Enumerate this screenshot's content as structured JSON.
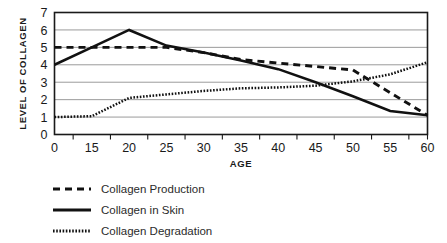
{
  "chart_data": {
    "type": "line",
    "title": "",
    "xlabel": "AGE",
    "ylabel": "LEVEL OF COLLAGEN",
    "categories": [
      "0",
      "15",
      "20",
      "25",
      "30",
      "35",
      "40",
      "45",
      "50",
      "55",
      "60"
    ],
    "x": [
      0,
      15,
      20,
      25,
      30,
      35,
      40,
      45,
      50,
      55,
      60
    ],
    "ylim": [
      0,
      7
    ],
    "yticks": [
      "0",
      "1",
      "2",
      "3",
      "4",
      "5",
      "6",
      "7"
    ],
    "grid": true,
    "legend_position": "below-left",
    "series": [
      {
        "name": "Collagen Production",
        "style": "dashed",
        "color": "#111111",
        "values": [
          5.0,
          5.0,
          5.0,
          5.0,
          4.7,
          4.3,
          4.1,
          3.9,
          3.7,
          2.4,
          1.1
        ]
      },
      {
        "name": "Collagen in Skin",
        "style": "solid",
        "color": "#111111",
        "values": [
          4.0,
          5.0,
          6.0,
          5.1,
          4.7,
          4.25,
          3.75,
          3.0,
          2.2,
          1.35,
          1.1
        ]
      },
      {
        "name": "Collagen Degradation",
        "style": "dotted",
        "color": "#111111",
        "values": [
          1.0,
          1.05,
          2.1,
          2.3,
          2.5,
          2.65,
          2.7,
          2.8,
          3.05,
          3.45,
          4.15
        ]
      }
    ]
  },
  "legend": {
    "items": [
      {
        "label": "Collagen Production",
        "marker": "dashed-line-icon"
      },
      {
        "label": "Collagen in Skin",
        "marker": "solid-line-icon"
      },
      {
        "label": "Collagen Degradation",
        "marker": "dotted-line-icon"
      }
    ]
  }
}
